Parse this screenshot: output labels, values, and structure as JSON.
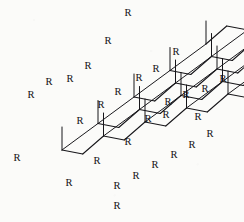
{
  "figure": {
    "kind": "chemical-structure-diagram",
    "substituent_label": "R",
    "background_color": "#fbfbf9",
    "line_color": "#17161a",
    "label_color": "#121114"
  },
  "chart_data": {
    "type": "diagram",
    "title": "",
    "xlabel": "",
    "ylabel": "",
    "substituent_label": "R",
    "row_count": 5,
    "rail_count": 6,
    "total_r_labels": 30,
    "rows": [
      {
        "row_index": 0,
        "zigzag_direction": "down",
        "r_labels": [
          "R",
          "R",
          "R",
          "R",
          "R",
          "R"
        ]
      },
      {
        "row_index": 1,
        "zigzag_direction": "down",
        "r_labels": [
          "R",
          "R",
          "R",
          "R",
          "R",
          "R"
        ]
      },
      {
        "row_index": 2,
        "zigzag_direction": "down",
        "r_labels": [
          "R",
          "R",
          "R",
          "R",
          "R",
          "R"
        ]
      },
      {
        "row_index": 3,
        "zigzag_direction": "mixed",
        "r_labels": [
          "R",
          "R",
          "R",
          "R",
          "R",
          "R"
        ]
      },
      {
        "row_index": 4,
        "zigzag_direction": "up",
        "r_labels": [
          "R",
          "R",
          "R",
          "R",
          "R",
          "R"
        ]
      }
    ],
    "geometry": {
      "origin": [
        62,
        150
      ],
      "chain_step": [
        41.5,
        -14.0
      ],
      "row_step": [
        36.0,
        -26.5
      ],
      "zigzag_amplitude": 11.0,
      "substituent_length": 23.0
    },
    "labels": [
      {
        "text": "R",
        "x": 128,
        "y": 14
      },
      {
        "text": "R",
        "x": 108,
        "y": 42
      },
      {
        "text": "R",
        "x": 176,
        "y": 53
      },
      {
        "text": "R",
        "x": 88,
        "y": 67
      },
      {
        "text": "R",
        "x": 156,
        "y": 70
      },
      {
        "text": "R",
        "x": 70,
        "y": 80
      },
      {
        "text": "R",
        "x": 139,
        "y": 79
      },
      {
        "text": "R",
        "x": 49,
        "y": 83
      },
      {
        "text": "R",
        "x": 223,
        "y": 80
      },
      {
        "text": "R",
        "x": 118,
        "y": 93
      },
      {
        "text": "R",
        "x": 31,
        "y": 96
      },
      {
        "text": "R",
        "x": 101,
        "y": 106
      },
      {
        "text": "R",
        "x": 186,
        "y": 96
      },
      {
        "text": "R",
        "x": 168,
        "y": 103
      },
      {
        "text": "R",
        "x": 205,
        "y": 90
      },
      {
        "text": "R",
        "x": 80,
        "y": 122
      },
      {
        "text": "R",
        "x": 148,
        "y": 120
      },
      {
        "text": "R",
        "x": 166,
        "y": 116
      },
      {
        "text": "R",
        "x": 128,
        "y": 143
      },
      {
        "text": "R",
        "x": 17,
        "y": 159
      },
      {
        "text": "R",
        "x": 210,
        "y": 135
      },
      {
        "text": "R",
        "x": 192,
        "y": 146
      },
      {
        "text": "R",
        "x": 174,
        "y": 156
      },
      {
        "text": "R",
        "x": 155,
        "y": 166
      },
      {
        "text": "R",
        "x": 136,
        "y": 177
      },
      {
        "text": "R",
        "x": 69,
        "y": 184
      },
      {
        "text": "R",
        "x": 117,
        "y": 187
      },
      {
        "text": "R",
        "x": 117,
        "y": 207
      },
      {
        "text": "R",
        "x": 97,
        "y": 162
      },
      {
        "text": "R",
        "x": 198,
        "y": 118
      }
    ]
  }
}
